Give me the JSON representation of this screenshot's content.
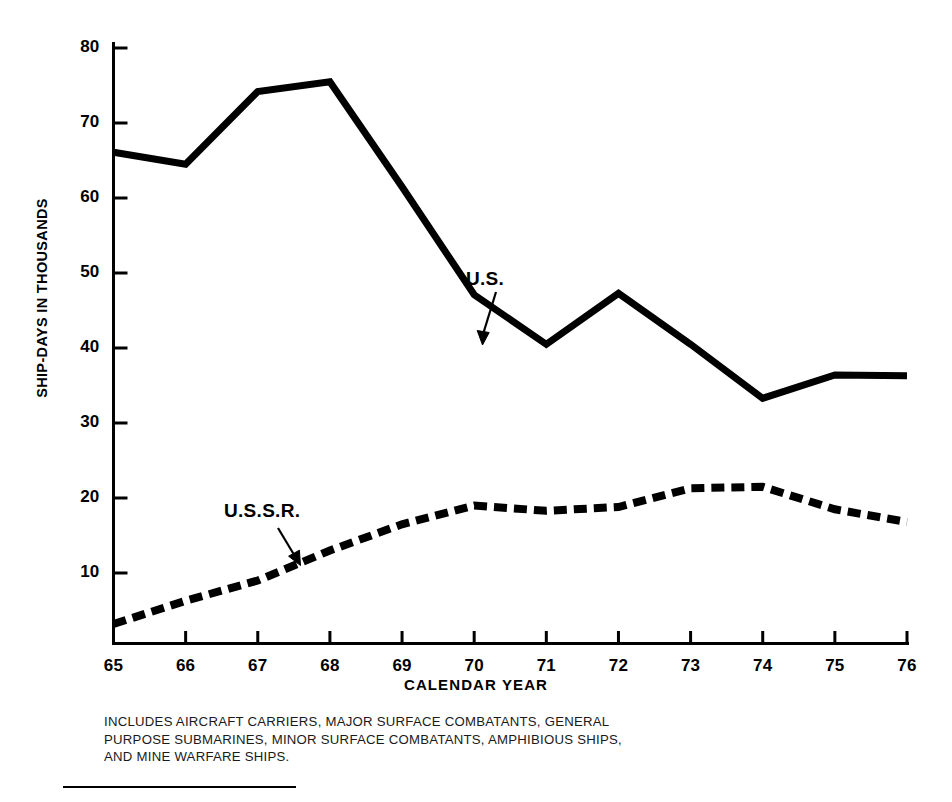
{
  "chart_data": {
    "type": "line",
    "title": "",
    "xlabel": "CALENDAR YEAR",
    "ylabel": "SHIP-DAYS IN THOUSANDS",
    "x": [
      65,
      66,
      67,
      68,
      69,
      70,
      71,
      72,
      73,
      74,
      75,
      76
    ],
    "xticklabels": [
      "65",
      "66",
      "67",
      "68",
      "69",
      "70",
      "71",
      "72",
      "73",
      "74",
      "75",
      "76"
    ],
    "yticklabels": [
      "10",
      "20",
      "30",
      "40",
      "50",
      "60",
      "70",
      "80"
    ],
    "yticks": [
      10,
      20,
      30,
      40,
      50,
      60,
      70,
      80
    ],
    "xlim": [
      65,
      76
    ],
    "ylim": [
      0,
      80
    ],
    "grid": false,
    "legend": "inline-annotations",
    "series": [
      {
        "name": "U.S.",
        "style": "solid",
        "color": "#000000",
        "width": 7,
        "values": [
          66.1,
          64.5,
          74.2,
          75.5,
          61.5,
          47.1,
          40.5,
          47.3,
          40.5,
          33.3,
          36.4,
          36.3
        ]
      },
      {
        "name": "U.S.S.R.",
        "style": "dashed",
        "color": "#000000",
        "width": 7,
        "values": [
          3.2,
          6.3,
          9.0,
          13.0,
          16.5,
          19.0,
          18.3,
          18.8,
          21.3,
          21.5,
          18.5,
          16.8
        ]
      }
    ],
    "annotations": [
      {
        "text": "U.S.",
        "target_x": 71,
        "target_y": 40.5
      },
      {
        "text": "U.S.S.R.",
        "target_x": 67.55,
        "target_y": 11.2
      }
    ]
  },
  "axis": {
    "y_title": "SHIP-DAYS IN THOUSANDS",
    "x_title": "CALENDAR YEAR",
    "y_ticks": [
      "80",
      "70",
      "60",
      "50",
      "40",
      "30",
      "20",
      "10"
    ],
    "x_ticks": [
      "65",
      "66",
      "67",
      "68",
      "69",
      "70",
      "71",
      "72",
      "73",
      "74",
      "75",
      "76"
    ]
  },
  "annotations": {
    "us": "U.S.",
    "ussr": "U.S.S.R."
  },
  "footnote": {
    "line1": "INCLUDES AIRCRAFT CARRIERS, MAJOR SURFACE COMBATANTS, GENERAL",
    "line2": "PURPOSE SUBMARINES, MINOR SURFACE COMBATANTS, AMPHIBIOUS SHIPS,",
    "line3": "AND MINE WARFARE SHIPS."
  },
  "colors": {
    "ink": "#000000",
    "background": "#ffffff"
  }
}
